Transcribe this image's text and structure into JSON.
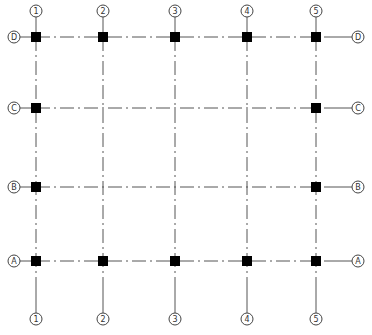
{
  "diagram": {
    "type": "structural-column-grid-plan",
    "colors": {
      "background": "#ffffff",
      "line": "#555555",
      "column": "#000000",
      "bubble_stroke": "#444444",
      "bubble_text": "#333333"
    },
    "columns_axes": [
      {
        "label": "1",
        "x": 36
      },
      {
        "label": "2",
        "x": 103
      },
      {
        "label": "3",
        "x": 175
      },
      {
        "label": "4",
        "x": 247
      },
      {
        "label": "5",
        "x": 316
      }
    ],
    "row_axes": [
      {
        "label": "D",
        "y": 37
      },
      {
        "label": "C",
        "y": 108
      },
      {
        "label": "B",
        "y": 187
      },
      {
        "label": "A",
        "y": 261
      }
    ],
    "bubbles": {
      "radius": 6,
      "top_y": 11,
      "bottom_y": 319,
      "left_x": 14,
      "right_x": 358
    },
    "column_markers": [
      {
        "axis": "1-D",
        "x": 36,
        "y": 37
      },
      {
        "axis": "2-D",
        "x": 103,
        "y": 37
      },
      {
        "axis": "3-D",
        "x": 175,
        "y": 37
      },
      {
        "axis": "4-D",
        "x": 247,
        "y": 37
      },
      {
        "axis": "5-D",
        "x": 316,
        "y": 37
      },
      {
        "axis": "1-C",
        "x": 36,
        "y": 108
      },
      {
        "axis": "5-C",
        "x": 316,
        "y": 108
      },
      {
        "axis": "1-B",
        "x": 36,
        "y": 187
      },
      {
        "axis": "5-B",
        "x": 316,
        "y": 187
      },
      {
        "axis": "1-A",
        "x": 36,
        "y": 261
      },
      {
        "axis": "2-A",
        "x": 103,
        "y": 261
      },
      {
        "axis": "3-A",
        "x": 175,
        "y": 261
      },
      {
        "axis": "4-A",
        "x": 247,
        "y": 261
      },
      {
        "axis": "5-A",
        "x": 316,
        "y": 261
      }
    ],
    "marker_size": 10
  }
}
